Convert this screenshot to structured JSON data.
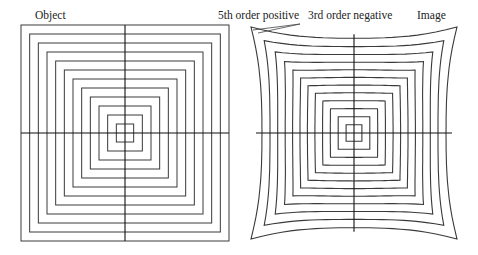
{
  "labels": {
    "object": "Object",
    "fifth_order": "5th order positive",
    "third_order": "3rd order negative",
    "image": "Image"
  },
  "colors": {
    "line": "#3a3a3a",
    "axis": "#111111",
    "background": "#ffffff"
  },
  "object_panel": {
    "center": [
      125,
      133
    ],
    "outer_half_width": 104,
    "outer_half_height": 108,
    "box_count": 12,
    "description": "Undistorted concentric squares with crosshair axes"
  },
  "image_panel": {
    "center": [
      354,
      133
    ],
    "outer_half_width": 103,
    "outer_half_height": 106,
    "box_count": 12,
    "k3": -0.22,
    "k5": 0.3,
    "description": "Concentric squares with combined 3rd-order negative (barrel) and 5th-order positive (pincushion) distortion"
  }
}
